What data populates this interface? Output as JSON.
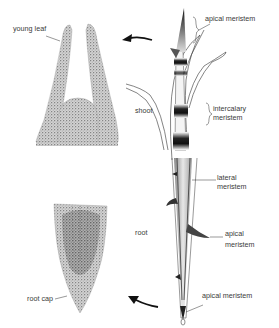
{
  "diagram": {
    "panels": [
      {
        "id": "shoot-tip-section",
        "description": "longitudinal section of shoot apex with young leaves"
      },
      {
        "id": "shoot",
        "description": "grass shoot with apical and intercalary meristems"
      },
      {
        "id": "root",
        "description": "root with lateral and apical meristems"
      },
      {
        "id": "root-tip-section",
        "description": "longitudinal section of root tip with root cap"
      }
    ],
    "labels": {
      "young_leaf": "young leaf",
      "apical_meristem_top": "apical meristem",
      "shoot": "shoot",
      "intercalary_1": "intercalary",
      "intercalary_2": "meristem",
      "lateral_1": "lateral",
      "lateral_2": "meristem",
      "root": "root",
      "apical_root_1": "apical",
      "apical_root_2": "meristem",
      "apical_meristem_bottom": "apical meristem",
      "root_cap": "root cap"
    },
    "colors": {
      "ink": "#1a1a1a",
      "stipple": "#8a8a8a",
      "label": "#3a3a3a",
      "background": "#ffffff"
    }
  }
}
